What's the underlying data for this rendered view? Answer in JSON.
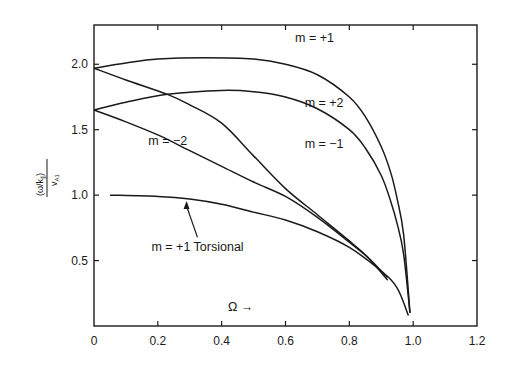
{
  "chart_data": {
    "type": "line",
    "title": "",
    "xlabel": "Ω →",
    "ylabel": "(ω/k∥) / vA1",
    "ylabel_numerator": "(ω/k",
    "ylabel_sub_num": "∥",
    "ylabel_close": ")",
    "ylabel_denominator": "v",
    "ylabel_sub_den": "A1",
    "xlim": [
      0,
      1.2
    ],
    "ylim": [
      0,
      2.3
    ],
    "grid": false,
    "legend": "inline labels",
    "x_ticks": [
      0,
      0.2,
      0.4,
      0.6,
      0.8,
      1.0,
      1.2
    ],
    "x_tick_labels": [
      "0",
      "0.2",
      "0.4",
      "0.6",
      "0.8",
      "1.0",
      "1.2"
    ],
    "y_ticks": [
      0.5,
      1.0,
      1.5,
      2.0
    ],
    "y_tick_labels": [
      "0.5",
      "1.0",
      "1.5",
      "2.0"
    ],
    "series": [
      {
        "name": "m = +1",
        "x": [
          0,
          0.1,
          0.2,
          0.35,
          0.5,
          0.6,
          0.7,
          0.8,
          0.85,
          0.9,
          0.93,
          0.95,
          0.97,
          0.99
        ],
        "values": [
          1.97,
          2.01,
          2.04,
          2.05,
          2.04,
          2.0,
          1.92,
          1.75,
          1.6,
          1.37,
          1.17,
          0.97,
          0.7,
          0.1
        ]
      },
      {
        "name": "m = +2",
        "x": [
          0,
          0.1,
          0.23,
          0.4,
          0.5,
          0.6,
          0.7,
          0.8,
          0.85,
          0.9,
          0.93,
          0.95,
          0.97,
          0.99
        ],
        "values": [
          1.65,
          1.71,
          1.77,
          1.8,
          1.79,
          1.75,
          1.66,
          1.5,
          1.36,
          1.15,
          0.95,
          0.78,
          0.55,
          0.1
        ]
      },
      {
        "name": "m = −1",
        "x": [
          0,
          0.1,
          0.23,
          0.3,
          0.4,
          0.5,
          0.6,
          0.7,
          0.8,
          0.86,
          0.92
        ],
        "values": [
          1.97,
          1.88,
          1.77,
          1.69,
          1.55,
          1.3,
          1.05,
          0.85,
          0.65,
          0.52,
          0.35
        ]
      },
      {
        "name": "m = −2",
        "x": [
          0,
          0.1,
          0.2,
          0.3,
          0.4,
          0.5,
          0.6,
          0.7,
          0.8,
          0.86,
          0.92
        ],
        "values": [
          1.65,
          1.56,
          1.46,
          1.34,
          1.22,
          1.1,
          0.99,
          0.83,
          0.64,
          0.52,
          0.37
        ]
      },
      {
        "name": "m = +1 Torsional",
        "x": [
          0.05,
          0.2,
          0.3,
          0.4,
          0.5,
          0.6,
          0.7,
          0.8,
          0.9,
          0.95,
          0.985
        ],
        "values": [
          1.0,
          0.99,
          0.97,
          0.93,
          0.87,
          0.81,
          0.72,
          0.6,
          0.42,
          0.29,
          0.08
        ]
      }
    ],
    "annotations": [
      {
        "text": "m = +1",
        "x": 0.63,
        "y": 2.17
      },
      {
        "text": "m = +2",
        "x": 0.66,
        "y": 1.67
      },
      {
        "text": "m = −1",
        "x": 0.66,
        "y": 1.36
      },
      {
        "text": "m = −2",
        "x": 0.17,
        "y": 1.38
      },
      {
        "text": "m = +1 Torsional",
        "x": 0.18,
        "y": 0.57,
        "arrow_to": [
          0.29,
          0.97
        ]
      }
    ]
  },
  "colors": {
    "line": "#1a1a1a",
    "background": "#ffffff"
  }
}
